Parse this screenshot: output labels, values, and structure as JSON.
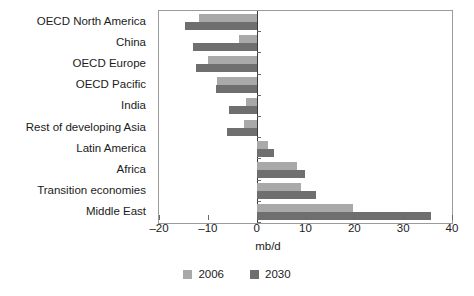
{
  "chart_data": {
    "type": "bar",
    "orientation": "horizontal",
    "title": "",
    "xlabel": "mb/d",
    "ylabel": "",
    "xlim": [
      -20,
      40
    ],
    "xticks": [
      -20,
      -10,
      0,
      10,
      20,
      30,
      40
    ],
    "xtick_labels": [
      "–20",
      "–10",
      "0",
      "10",
      "20",
      "30",
      "40"
    ],
    "grid": false,
    "legend_position": "bottom",
    "categories": [
      "OECD North America",
      "China",
      "OECD Europe",
      "OECD Pacific",
      "India",
      "Rest of developing Asia",
      "Latin America",
      "Africa",
      "Transition economies",
      "Middle East"
    ],
    "series": [
      {
        "name": "2006",
        "color": "#a9a9a9",
        "values": [
          -11.8,
          -3.6,
          -10.0,
          -8.2,
          -2.1,
          -2.5,
          2.3,
          8.2,
          9.0,
          19.8
        ]
      },
      {
        "name": "2030",
        "color": "#6f6f6f",
        "values": [
          -14.7,
          -13.0,
          -12.4,
          -8.4,
          -5.7,
          -6.0,
          3.6,
          10.0,
          12.2,
          35.6
        ]
      }
    ]
  },
  "axis": {
    "x_axis_title": "mb/d"
  },
  "legend": {
    "items": [
      {
        "label": "2006",
        "color": "#a9a9a9"
      },
      {
        "label": "2030",
        "color": "#6f6f6f"
      }
    ]
  }
}
